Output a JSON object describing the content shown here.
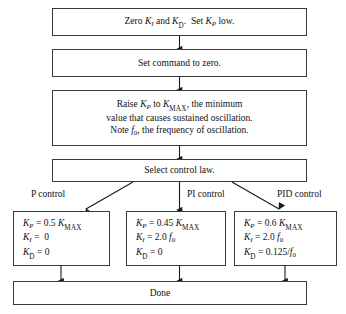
{
  "diagram": {
    "steps": [
      {
        "id": "step-zero-gains",
        "lines": [
          "Zero K_I and K_D.  Set K_P low."
        ],
        "text": "Zero KI and KD. Set KP low."
      },
      {
        "id": "step-set-command-zero",
        "lines": [
          "Set command to zero."
        ],
        "text": "Set command to zero."
      },
      {
        "id": "step-raise-kp",
        "lines": [
          "Raise K_P to K_MAX, the minimum",
          "value that causes sustained oscillation.",
          "Note f_0, the frequency of oscillation."
        ],
        "text": "Raise KP to KMAX, the minimum value that causes sustained oscillation. Note f0, the frequency of oscillation."
      },
      {
        "id": "step-select-control-law",
        "lines": [
          "Select control law."
        ],
        "text": "Select control law."
      }
    ],
    "branch_labels": [
      {
        "id": "branch-p",
        "label": "P control"
      },
      {
        "id": "branch-pi",
        "label": "PI control"
      },
      {
        "id": "branch-pid",
        "label": "PID control"
      }
    ],
    "results": [
      {
        "id": "result-p-control",
        "equations": [
          {
            "gain": "K_P",
            "value": "0.5 K_MAX"
          },
          {
            "gain": "K_I",
            "value": "0"
          },
          {
            "gain": "K_D",
            "value": "0"
          }
        ]
      },
      {
        "id": "result-pi-control",
        "equations": [
          {
            "gain": "K_P",
            "value": "0.45 K_MAX"
          },
          {
            "gain": "K_I",
            "value": "2.0 f_0"
          },
          {
            "gain": "K_D",
            "value": "0"
          }
        ]
      },
      {
        "id": "result-pid-control",
        "equations": [
          {
            "gain": "K_P",
            "value": "0.6 K_MAX"
          },
          {
            "gain": "K_I",
            "value": "2.0 f_0"
          },
          {
            "gain": "K_D",
            "value": "0.125/f_0"
          }
        ]
      }
    ],
    "terminal": {
      "id": "step-done",
      "label": "Done"
    },
    "colors": {
      "border": "#3a3a3a",
      "text": "#111111",
      "background": "#ffffff",
      "arrow": "#1a1a1a"
    }
  }
}
